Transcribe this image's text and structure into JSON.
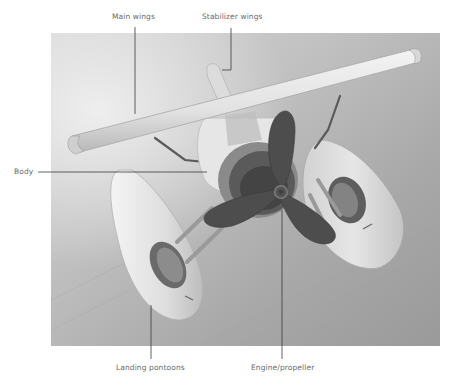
{
  "figure": {
    "labels": {
      "main_wings": "Main wings",
      "stabilizer_wings": "Stabilizer wings",
      "body": "Body",
      "landing_pontoons": "Landing pontoons",
      "engine_propeller": "Engine/propeller"
    },
    "colors": {
      "background": "#ffffff",
      "label_text": "#6a6a6a",
      "leader_line": "#3a3a3a",
      "photo_backdrop": "#b9b9b9",
      "plane_white": "#e9e9e9",
      "propeller_dark": "#4a4a4a"
    }
  }
}
